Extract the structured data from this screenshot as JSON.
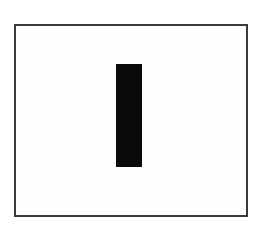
{
  "diagram": {
    "frame": {
      "shape": "rectangle-outline",
      "border_color": "#3a3a3a",
      "fill": "#fefefe"
    },
    "bar": {
      "shape": "vertical-filled-rectangle",
      "color": "#0a0a0a"
    }
  }
}
